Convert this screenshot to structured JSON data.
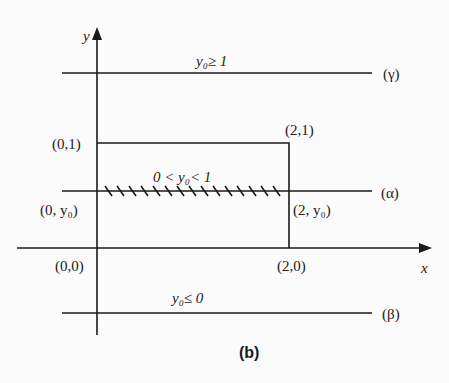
{
  "diagram": {
    "caption": "(b)",
    "axes": {
      "x_label": "x",
      "y_label": "y"
    },
    "lines": {
      "gamma": {
        "label": "(γ)",
        "condition": "y₀≥ 1"
      },
      "alpha": {
        "label": "(α)",
        "condition": "0 < y₀< 1"
      },
      "beta": {
        "label": "(β)",
        "condition": "y₀≤ 0"
      }
    },
    "points": {
      "p01": "(0,1)",
      "p21": "(2,1)",
      "p0y0": "(0, y₀)",
      "p2y0": "(2, y₀)",
      "p00": "(0,0)",
      "p20": "(2,0)"
    },
    "colors": {
      "stroke": "#1a1a1a",
      "background": "#fbfbfb"
    }
  }
}
